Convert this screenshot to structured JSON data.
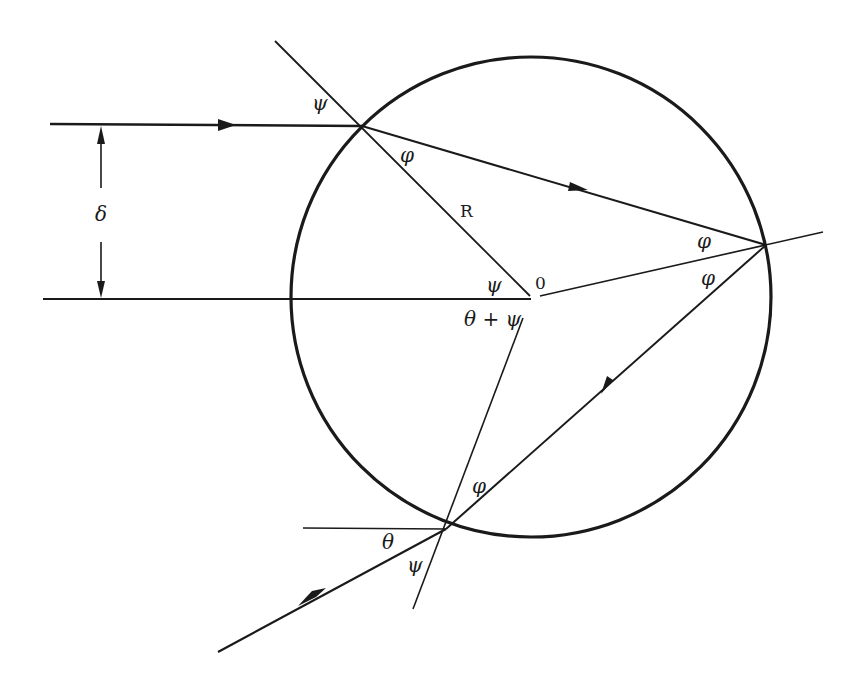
{
  "diagram": {
    "colors": {
      "stroke": "#1a1a1a",
      "background": "#ffffff"
    },
    "circle": {
      "cx": 531,
      "cy": 297,
      "r": 240
    },
    "points": {
      "entry": {
        "x": 362,
        "y": 126
      },
      "reflection": {
        "x": 766,
        "y": 245
      },
      "exit": {
        "x": 446,
        "y": 529
      },
      "center": {
        "x": 530,
        "y": 298
      }
    },
    "labels": {
      "psi_entry_outer": "ψ",
      "phi_entry_inner": "φ",
      "radius": "R",
      "psi_center": "ψ",
      "center": "0",
      "theta_plus_psi": "θ + ψ",
      "phi_reflect_upper": "φ",
      "phi_reflect_lower": "φ",
      "phi_exit_inner": "φ",
      "theta_exit": "θ",
      "psi_exit_outer": "ψ",
      "impact_parameter": "δ"
    }
  }
}
